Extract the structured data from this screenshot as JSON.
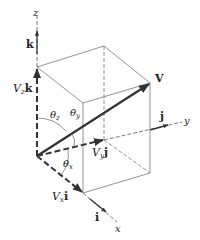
{
  "diagram": {
    "axes": {
      "x": {
        "label": "x",
        "unit_vector": "i"
      },
      "y": {
        "label": "y",
        "unit_vector": "j"
      },
      "z": {
        "label": "z",
        "unit_vector": "k"
      }
    },
    "vector": {
      "label": "V"
    },
    "components": {
      "x": {
        "scalar": "V",
        "sub": "x",
        "unit": "i"
      },
      "y": {
        "scalar": "V",
        "sub": "y",
        "unit": "j"
      },
      "z": {
        "scalar": "V",
        "sub": "z",
        "unit": "k"
      }
    },
    "angles": {
      "x": {
        "symbol": "θ",
        "sub": "x"
      },
      "y": {
        "symbol": "θ",
        "sub": "y"
      },
      "z": {
        "symbol": "θ",
        "sub": "z"
      }
    },
    "colors": {
      "line": "#333333",
      "box": "#777777",
      "vector": "#333333"
    }
  }
}
